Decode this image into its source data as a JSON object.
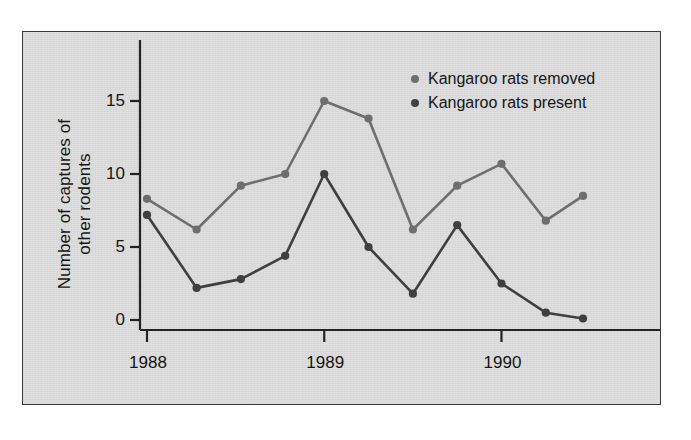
{
  "chart_data": {
    "type": "line",
    "title": "",
    "xlabel": "",
    "ylabel": "Number of captures of\nother rodents",
    "ylabel_line1": "Number of captures of",
    "ylabel_line2": "other rodents",
    "xlim": [
      1987.93,
      1990.43
    ],
    "ylim": [
      -0.6,
      16.8
    ],
    "yticks": [
      0,
      5,
      10,
      15
    ],
    "ytick_labels": [
      "0",
      "5",
      "10",
      "15"
    ],
    "xticks": [
      1988,
      1989,
      1990
    ],
    "xtick_labels": [
      "1988",
      "1989",
      "1990"
    ],
    "grid": false,
    "legend_position": "top-right",
    "x": [
      1988.0,
      1988.28,
      1988.53,
      1988.78,
      1989.0,
      1989.25,
      1989.5,
      1989.75,
      1990.0,
      1990.25,
      1990.46
    ],
    "series": [
      {
        "name": "Kangaroo rats removed",
        "color": "#6e6e6e",
        "marker": "circle",
        "values": [
          8.3,
          6.2,
          9.2,
          10.0,
          15.0,
          13.8,
          6.2,
          9.2,
          10.7,
          6.8,
          8.5
        ]
      },
      {
        "name": "Kangaroo rats present",
        "color": "#3f3f3f",
        "marker": "circle",
        "values": [
          7.2,
          2.2,
          2.8,
          4.4,
          10.0,
          5.0,
          1.8,
          6.5,
          2.5,
          0.5,
          0.1
        ]
      }
    ]
  },
  "legend": {
    "items": [
      {
        "label": "Kangaroo rats removed",
        "color": "#6e6e6e"
      },
      {
        "label": "Kangaroo rats present",
        "color": "#3f3f3f"
      }
    ]
  },
  "axes": {
    "y_title_line1": "Number of captures of",
    "y_title_line2": "other rodents",
    "y_tick_labels": [
      "15",
      "10",
      "5",
      "0"
    ],
    "x_tick_labels": [
      "1988",
      "1989",
      "1990"
    ]
  },
  "colors": {
    "panel_background": "#dedede",
    "frame": "#3a3a3a",
    "axis": "#222222",
    "series_removed": "#6e6e6e",
    "series_present": "#3f3f3f",
    "text": "#111111"
  }
}
